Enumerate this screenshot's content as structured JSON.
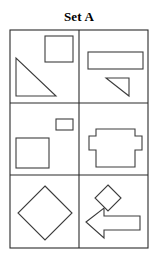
{
  "title": "Set A",
  "figure": {
    "label": "Set A",
    "background_color": "#ffffff",
    "stroke_color": "#3c3c3c",
    "frame_color": "#2b2b2b",
    "columns": 2,
    "rows": 3,
    "frame": {
      "x": 10,
      "y": 30,
      "width": 138,
      "height": 218
    },
    "dividers": {
      "vertical_x": [
        79
      ],
      "horizontal_y": [
        103,
        175
      ]
    }
  },
  "cells": [
    {
      "id": "cell-r1c1",
      "row": 1,
      "column": 1,
      "shapes": [
        {
          "name": "square",
          "type": "rect",
          "x": 45,
          "y": 36,
          "width": 28,
          "height": 26
        },
        {
          "name": "right-triangle",
          "type": "polygon",
          "points": "16,58 16,96 56,96"
        }
      ]
    },
    {
      "id": "cell-r1c2",
      "row": 1,
      "column": 2,
      "shapes": [
        {
          "name": "wide-rectangle",
          "type": "rect",
          "x": 88,
          "y": 52,
          "width": 55,
          "height": 17
        },
        {
          "name": "right-triangle",
          "type": "polygon",
          "points": "106,78 129,78 129,96"
        }
      ]
    },
    {
      "id": "cell-r2c1",
      "row": 2,
      "column": 1,
      "shapes": [
        {
          "name": "small-rectangle",
          "type": "rect",
          "x": 56,
          "y": 119,
          "width": 17,
          "height": 11
        },
        {
          "name": "large-square",
          "type": "rect",
          "x": 16,
          "y": 138,
          "width": 33,
          "height": 30
        }
      ]
    },
    {
      "id": "cell-r2c2",
      "row": 2,
      "column": 2,
      "shapes": [
        {
          "name": "tabbed-rectangle",
          "type": "polygon",
          "points": "96,129 135,129 135,136 142,136 142,150 135,150 135,167 96,167 96,150 89,150 89,136 96,136"
        }
      ]
    },
    {
      "id": "cell-r3c1",
      "row": 3,
      "column": 1,
      "shapes": [
        {
          "name": "large-diamond",
          "type": "polygon",
          "points": "45,186 72,213 45,240 18,213"
        }
      ]
    },
    {
      "id": "cell-r3c2",
      "row": 3,
      "column": 2,
      "shapes": [
        {
          "name": "small-diamond",
          "type": "polygon",
          "points": "108,185 121,198 108,211 95,198"
        },
        {
          "name": "left-arrow",
          "type": "polygon",
          "points": "86,222 104,208 104,216 140,216 140,230 104,230 104,238"
        }
      ]
    }
  ]
}
